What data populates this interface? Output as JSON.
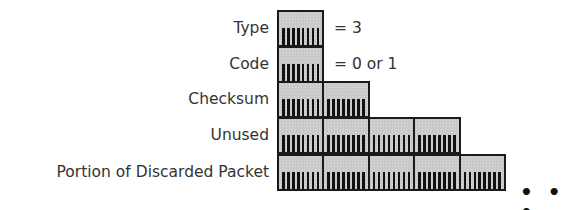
{
  "diagram": {
    "type": "packet-field-layout",
    "unit": "byte (8 bits per box)",
    "fields": [
      {
        "label": "Type",
        "bytes": 1,
        "value": "= 3"
      },
      {
        "label": "Code",
        "bytes": 1,
        "value": "= 0 or 1"
      },
      {
        "label": "Checksum",
        "bytes": 2,
        "value": ""
      },
      {
        "label": "Unused",
        "bytes": 4,
        "value": ""
      },
      {
        "label": "Portion of Discarded Packet",
        "bytes": 5,
        "value": ""
      }
    ],
    "continuation": "• • •",
    "colors": {
      "cell_fill": "#c9c9c9",
      "cell_border": "#1a1a1a",
      "tick": "#111111",
      "text": "#333333"
    }
  }
}
